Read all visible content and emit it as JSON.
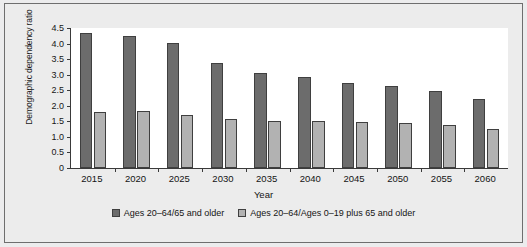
{
  "chart_data": {
    "type": "bar",
    "title": "",
    "xlabel": "Year",
    "ylabel": "Demographic dependency ratio",
    "categories": [
      "2015",
      "2020",
      "2025",
      "2030",
      "2035",
      "2040",
      "2045",
      "2050",
      "2055",
      "2060"
    ],
    "series": [
      {
        "name": "Ages 20–64/65 and older",
        "color": "#6c6c6c",
        "values": [
          4.33,
          4.23,
          4.01,
          3.36,
          3.06,
          2.93,
          2.74,
          2.64,
          2.48,
          2.21
        ]
      },
      {
        "name": "Ages 20–64/Ages 0–19 plus 65 and older",
        "color": "#b2b2b2",
        "values": [
          1.79,
          1.83,
          1.69,
          1.56,
          1.52,
          1.52,
          1.49,
          1.45,
          1.38,
          1.25
        ]
      }
    ],
    "ylim": [
      0,
      4.5
    ],
    "yticks": [
      "0",
      "0.5",
      "1.0",
      "1.5",
      "2.0",
      "2.5",
      "3.0",
      "3.5",
      "4.0",
      "4.5"
    ],
    "ytick_values": [
      0,
      0.5,
      1.0,
      1.5,
      2.0,
      2.5,
      3.0,
      3.5,
      4.0,
      4.5
    ],
    "grid": false,
    "legend_position": "bottom"
  }
}
